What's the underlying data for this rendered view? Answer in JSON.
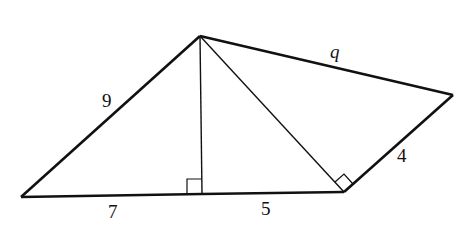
{
  "diagram": {
    "type": "geometry-figure",
    "colors": {
      "stroke": "#111111",
      "background": "#ffffff"
    },
    "vertices": {
      "A": {
        "x": 200,
        "y": 36
      },
      "B": {
        "x": 21,
        "y": 197
      },
      "D": {
        "x": 202,
        "y": 194
      },
      "C": {
        "x": 344,
        "y": 192
      },
      "E": {
        "x": 453,
        "y": 95
      }
    },
    "segments": [
      {
        "name": "side-AB",
        "from": "A",
        "to": "B",
        "weight": "bold"
      },
      {
        "name": "side-BD",
        "from": "B",
        "to": "D",
        "weight": "bold"
      },
      {
        "name": "side-DC",
        "from": "D",
        "to": "C",
        "weight": "bold"
      },
      {
        "name": "side-CE",
        "from": "C",
        "to": "E",
        "weight": "bold"
      },
      {
        "name": "side-AE",
        "from": "A",
        "to": "E",
        "weight": "bold"
      },
      {
        "name": "altitude-AD",
        "from": "A",
        "to": "D",
        "weight": "thin"
      },
      {
        "name": "diagonal-AC",
        "from": "A",
        "to": "C",
        "weight": "thin"
      }
    ],
    "right_angle_markers": [
      {
        "name": "right-angle-at-D",
        "vertex": "D"
      },
      {
        "name": "right-angle-at-C",
        "vertex": "C"
      }
    ],
    "labels": {
      "ab": {
        "text": "9",
        "x": 102,
        "y": 107
      },
      "ae": {
        "text": "q",
        "x": 330,
        "y": 58
      },
      "bd": {
        "text": "7",
        "x": 108,
        "y": 218
      },
      "dc": {
        "text": "5",
        "x": 261,
        "y": 215
      },
      "ce": {
        "text": "4",
        "x": 397,
        "y": 162
      }
    }
  }
}
